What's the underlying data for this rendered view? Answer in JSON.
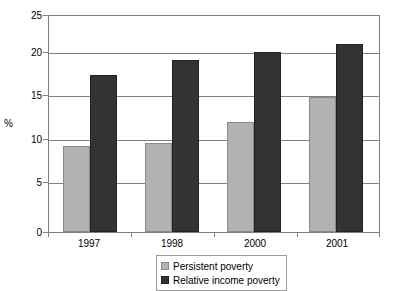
{
  "chart_data": {
    "type": "bar",
    "title": "",
    "xlabel": "",
    "ylabel": "%",
    "categories": [
      "1997",
      "1998",
      "2000",
      "2001"
    ],
    "series": [
      {
        "name": "Persistent poverty",
        "color": "#b2b2b2",
        "values": [
          10.0,
          10.3,
          12.7,
          15.6
        ]
      },
      {
        "name": "Relative income poverty",
        "color": "#333333",
        "values": [
          18.2,
          19.9,
          20.8,
          21.8
        ]
      }
    ],
    "ylim": [
      0,
      25
    ],
    "yticks": [
      0,
      5,
      10,
      15,
      20,
      25
    ],
    "ytick_labels": [
      "0",
      "5",
      "10",
      "15",
      "20",
      "25"
    ],
    "grid": true,
    "legend_position": "bottom-center"
  },
  "legend": {
    "items": [
      {
        "label": "Persistent poverty",
        "marker": "light-square-swatch"
      },
      {
        "label": "Relative income poverty",
        "marker": "dark-square-swatch"
      }
    ]
  },
  "colors": {
    "persistent_poverty": "#b2b2b2",
    "relative_income_poverty": "#333333",
    "gridline": "#808080",
    "background": "#ffffff"
  }
}
